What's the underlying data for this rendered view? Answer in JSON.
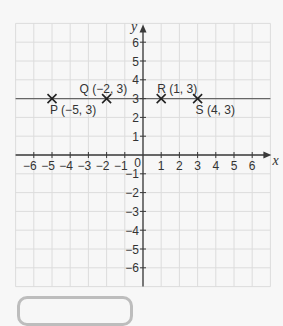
{
  "chart_data": {
    "type": "scatter",
    "title": "",
    "xlabel": "x",
    "ylabel": "y",
    "xlim": [
      -7,
      7
    ],
    "ylim": [
      -7,
      7
    ],
    "grid": true,
    "x_ticks": [
      -6,
      -5,
      -4,
      -3,
      -2,
      -1,
      1,
      2,
      3,
      4,
      5,
      6
    ],
    "y_ticks": [
      -6,
      -5,
      -4,
      -3,
      -2,
      -1,
      1,
      2,
      3,
      4,
      5,
      6
    ],
    "origin_label": "0",
    "horizontal_line": {
      "y": 3
    },
    "points": [
      {
        "name": "P",
        "label": "P (−5, 3)",
        "x": -5,
        "y": 3,
        "plot_x": -5,
        "label_pos": "below"
      },
      {
        "name": "Q",
        "label": "Q (−2, 3)",
        "x": -2,
        "y": 3,
        "plot_x": -2,
        "label_pos": "above"
      },
      {
        "name": "R",
        "label": "R (1, 3)",
        "x": 1,
        "y": 3,
        "plot_x": 1,
        "label_pos": "above"
      },
      {
        "name": "S",
        "label": "S (4, 3)",
        "x": 4,
        "y": 3,
        "plot_x": 3,
        "label_pos": "below"
      }
    ]
  },
  "colors": {
    "grid": "#dcdcdc",
    "axis": "#3a3a3a",
    "background": "#f7f7f7",
    "box_border": "#bdbdbd"
  }
}
